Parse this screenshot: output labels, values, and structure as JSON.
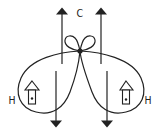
{
  "diagram": {
    "labels": {
      "top_center": "C",
      "left": "H",
      "right": "H"
    },
    "icons": {
      "left_house": "house-icon",
      "right_house": "house-icon"
    },
    "colors": {
      "stroke": "#222222",
      "background": "#ffffff"
    }
  }
}
